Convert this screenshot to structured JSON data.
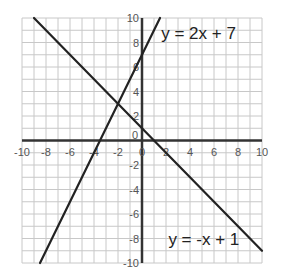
{
  "chart_data": {
    "type": "line",
    "title": "",
    "xlabel": "",
    "ylabel": "",
    "xlim": [
      -10,
      10
    ],
    "ylim": [
      -10,
      10
    ],
    "grid": true,
    "grid_step": 1,
    "x_ticks": [
      -10,
      -8,
      -6,
      -4,
      -2,
      0,
      2,
      4,
      6,
      8,
      10
    ],
    "y_ticks": [
      -10,
      -8,
      -6,
      -4,
      -2,
      0,
      2,
      4,
      6,
      8,
      10
    ],
    "series": [
      {
        "name": "y = 2x + 7",
        "slope": 2,
        "intercept": 7,
        "points": [
          [
            -8.5,
            -10
          ],
          [
            1.5,
            10
          ]
        ],
        "color": "#222222"
      },
      {
        "name": "y = -x + 1",
        "slope": -1,
        "intercept": 1,
        "points": [
          [
            -9,
            10
          ],
          [
            10,
            -9
          ]
        ],
        "color": "#222222"
      }
    ],
    "annotations": [
      {
        "text": "y = 2x + 7",
        "x": 1.6,
        "y": 8.3
      },
      {
        "text": "y = -x + 1",
        "x": 2.2,
        "y": -8.5
      }
    ],
    "intersection": [
      -2,
      3
    ]
  },
  "colors": {
    "grid": "#c8c8c8",
    "axis": "#333333",
    "line": "#222222",
    "background": "#ffffff"
  }
}
